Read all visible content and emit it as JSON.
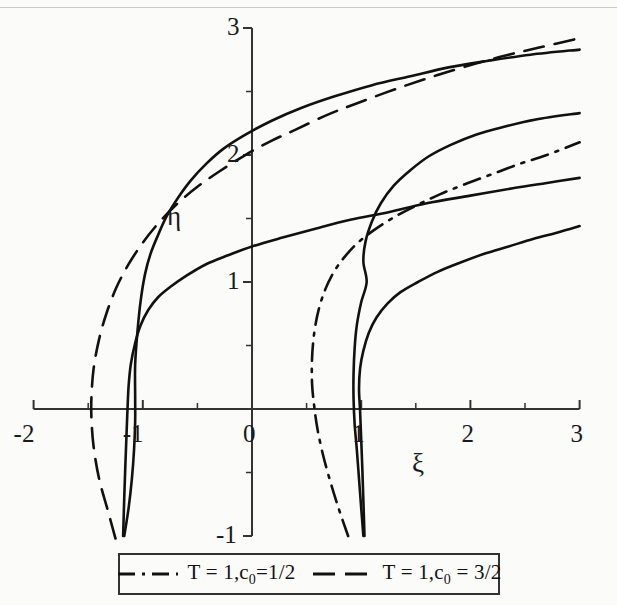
{
  "figure": {
    "background_color": "#fbfbfa",
    "line_color": "#111111",
    "axis_color": "#333333",
    "width": 617,
    "height": 605
  },
  "axes": {
    "x_name": "ξ",
    "y_name": "η",
    "x_ticks": [
      "-2",
      "-1",
      "0",
      "1",
      "2",
      "3"
    ],
    "x_tick_values": [
      -2,
      -1,
      0,
      1,
      2,
      3
    ],
    "y_ticks": [
      "-1",
      "1",
      "2",
      "3"
    ],
    "y_tick_values": [
      -1,
      1,
      2,
      3
    ],
    "y_minor_values": [
      -0.5,
      0.5,
      1.5,
      2.5
    ],
    "xlim": [
      -2,
      3
    ],
    "ylim": [
      -1,
      3
    ]
  },
  "legend": {
    "position": "below-plot",
    "entries": [
      {
        "label": "T = 1,c",
        "sub": "0",
        "label_tail": "=1/2",
        "style": "dash-dot",
        "full": "T = 1,c0=1/2"
      },
      {
        "label": "T = 1,c",
        "sub": "0",
        "label_tail": " = 3/2",
        "style": "dash",
        "full": "T = 1,c0 = 3/2"
      }
    ]
  },
  "chart_data": {
    "type": "line",
    "title": "",
    "xlabel": "ξ",
    "ylabel": "η",
    "xlim": [
      -2,
      3
    ],
    "ylim": [
      -1,
      3
    ],
    "grid": false,
    "legend_position": "bottom",
    "series": [
      {
        "name": "T = 1,c0 = 3/2 (upper branch)",
        "style": "dash",
        "comment": "dashed upper curve of the c0=3/2 pair",
        "points": [
          [
            -1.25,
            -1.02
          ],
          [
            -1.32,
            -0.8
          ],
          [
            -1.4,
            -0.55
          ],
          [
            -1.45,
            -0.3
          ],
          [
            -1.47,
            -0.08
          ],
          [
            -1.47,
            0.1
          ],
          [
            -1.45,
            0.32
          ],
          [
            -1.4,
            0.55
          ],
          [
            -1.33,
            0.76
          ],
          [
            -1.24,
            0.96
          ],
          [
            -1.13,
            1.14
          ],
          [
            -1.0,
            1.31
          ],
          [
            -0.85,
            1.47
          ],
          [
            -0.68,
            1.62
          ],
          [
            -0.5,
            1.75
          ],
          [
            -0.3,
            1.87
          ],
          [
            -0.08,
            1.99
          ],
          [
            0.15,
            2.1
          ],
          [
            0.4,
            2.2
          ],
          [
            0.7,
            2.32
          ],
          [
            1.0,
            2.42
          ],
          [
            1.35,
            2.53
          ],
          [
            1.7,
            2.63
          ],
          [
            2.05,
            2.72
          ],
          [
            2.35,
            2.79
          ],
          [
            2.65,
            2.85
          ],
          [
            3.0,
            2.92
          ]
        ]
      },
      {
        "name": "T = 1,c0 = 3/2 (solid upper branch)",
        "style": "solid",
        "comment": "topmost solid curve, turning point near xi=-1.07",
        "points": [
          [
            -1.17,
            -1.0
          ],
          [
            -1.13,
            -0.78
          ],
          [
            -1.1,
            -0.55
          ],
          [
            -1.08,
            -0.32
          ],
          [
            -1.07,
            -0.1
          ],
          [
            -1.07,
            0.1
          ],
          [
            -1.07,
            0.35
          ],
          [
            -1.05,
            0.6
          ],
          [
            -1.02,
            0.85
          ],
          [
            -0.98,
            1.06
          ],
          [
            -0.93,
            1.22
          ],
          [
            -0.86,
            1.37
          ],
          [
            -0.78,
            1.52
          ],
          [
            -0.68,
            1.66
          ],
          [
            -0.56,
            1.8
          ],
          [
            -0.42,
            1.93
          ],
          [
            -0.26,
            2.05
          ],
          [
            -0.06,
            2.16
          ],
          [
            0.18,
            2.27
          ],
          [
            0.45,
            2.37
          ],
          [
            0.75,
            2.46
          ],
          [
            1.1,
            2.55
          ],
          [
            1.45,
            2.62
          ],
          [
            1.8,
            2.69
          ],
          [
            2.15,
            2.74
          ],
          [
            2.55,
            2.79
          ],
          [
            3.0,
            2.83
          ]
        ]
      },
      {
        "name": "T = 1,c0 = 3/2 (solid lower branch)",
        "style": "solid",
        "comment": "lower solid curve of left pair; passes through eta=1 near xi=-0.3",
        "points": [
          [
            -1.18,
            -1.0
          ],
          [
            -1.17,
            -0.7
          ],
          [
            -1.16,
            -0.45
          ],
          [
            -1.15,
            -0.22
          ],
          [
            -1.14,
            0.0
          ],
          [
            -1.13,
            0.18
          ],
          [
            -1.11,
            0.35
          ],
          [
            -1.07,
            0.52
          ],
          [
            -1.02,
            0.66
          ],
          [
            -0.95,
            0.78
          ],
          [
            -0.86,
            0.88
          ],
          [
            -0.75,
            0.96
          ],
          [
            -0.6,
            1.05
          ],
          [
            -0.42,
            1.14
          ],
          [
            -0.22,
            1.21
          ],
          [
            0.0,
            1.28
          ],
          [
            0.28,
            1.35
          ],
          [
            0.58,
            1.42
          ],
          [
            0.9,
            1.49
          ],
          [
            1.25,
            1.55
          ],
          [
            1.6,
            1.62
          ],
          [
            2.0,
            1.68
          ],
          [
            2.4,
            1.74
          ],
          [
            2.7,
            1.78
          ],
          [
            3.0,
            1.82
          ]
        ]
      },
      {
        "name": "T = 1,c0 = 1/2 (dash-dot branch)",
        "style": "dash-dot",
        "comment": "dash-dot curve of the right pair, turning near xi=0.55",
        "points": [
          [
            0.88,
            -1.0
          ],
          [
            0.8,
            -0.8
          ],
          [
            0.72,
            -0.58
          ],
          [
            0.65,
            -0.36
          ],
          [
            0.6,
            -0.16
          ],
          [
            0.57,
            0.02
          ],
          [
            0.55,
            0.2
          ],
          [
            0.55,
            0.4
          ],
          [
            0.57,
            0.6
          ],
          [
            0.61,
            0.78
          ],
          [
            0.67,
            0.94
          ],
          [
            0.75,
            1.08
          ],
          [
            0.85,
            1.2
          ],
          [
            0.97,
            1.31
          ],
          [
            1.12,
            1.41
          ],
          [
            1.3,
            1.51
          ],
          [
            1.5,
            1.6
          ],
          [
            1.72,
            1.69
          ],
          [
            1.95,
            1.77
          ],
          [
            2.2,
            1.85
          ],
          [
            2.45,
            1.93
          ],
          [
            2.7,
            2.0
          ],
          [
            3.0,
            2.1
          ]
        ]
      },
      {
        "name": "T = 1,c0 = 1/2 (solid upper branch)",
        "style": "solid",
        "comment": "solid curve of right pair rising steeply from xi~0.93",
        "points": [
          [
            1.02,
            -1.0
          ],
          [
            1.0,
            -0.78
          ],
          [
            0.98,
            -0.55
          ],
          [
            0.96,
            -0.32
          ],
          [
            0.94,
            -0.12
          ],
          [
            0.93,
            0.08
          ],
          [
            0.93,
            0.28
          ],
          [
            0.94,
            0.48
          ],
          [
            0.96,
            0.66
          ],
          [
            1.0,
            0.84
          ],
          [
            1.05,
            1.0
          ],
          [
            1.02,
            1.16
          ],
          [
            1.04,
            1.32
          ],
          [
            1.1,
            1.48
          ],
          [
            1.18,
            1.62
          ],
          [
            1.3,
            1.76
          ],
          [
            1.45,
            1.88
          ],
          [
            1.62,
            1.99
          ],
          [
            1.82,
            2.08
          ],
          [
            2.05,
            2.16
          ],
          [
            2.3,
            2.22
          ],
          [
            2.6,
            2.28
          ],
          [
            3.0,
            2.33
          ]
        ]
      },
      {
        "name": "T = 1,c0 = 1/2 (solid lower branch)",
        "style": "solid",
        "comment": "bottom-right solid curve, passes eta=1 near xi=1.55",
        "points": [
          [
            1.03,
            -1.0
          ],
          [
            1.02,
            -0.72
          ],
          [
            1.01,
            -0.46
          ],
          [
            1.0,
            -0.24
          ],
          [
            0.99,
            -0.02
          ],
          [
            0.98,
            0.16
          ],
          [
            0.99,
            0.32
          ],
          [
            1.02,
            0.46
          ],
          [
            1.07,
            0.6
          ],
          [
            1.14,
            0.72
          ],
          [
            1.24,
            0.83
          ],
          [
            1.36,
            0.92
          ],
          [
            1.52,
            1.0
          ],
          [
            1.7,
            1.08
          ],
          [
            1.9,
            1.15
          ],
          [
            2.12,
            1.22
          ],
          [
            2.35,
            1.28
          ],
          [
            2.58,
            1.34
          ],
          [
            2.8,
            1.39
          ],
          [
            3.0,
            1.44
          ]
        ]
      }
    ]
  }
}
